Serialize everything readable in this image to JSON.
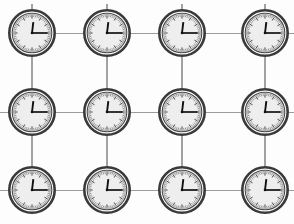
{
  "scene": {
    "title": "Grid of wall clocks",
    "description": "Twelve identical analog wall clocks arranged in a 4 by 3 lattice, joined by thin grey connecting lines",
    "width": 294,
    "height": 224,
    "background_color": "#fdfdfd"
  },
  "style": {
    "line_color": "#9b9b9b",
    "bezel_color": "#3a3a3a",
    "face_color": "#eeeeee",
    "hand_color": "#111111"
  },
  "layout": {
    "columns": 4,
    "rows": 3,
    "column_centers_x": [
      32,
      107,
      182,
      265
    ],
    "row_centers_y": [
      33,
      112,
      190
    ],
    "clock_radius": 24
  },
  "clock_common": {
    "time_label": "12:15",
    "hour_hand_angle_deg": 7,
    "minute_hand_angle_deg": 90,
    "tick_count": 60,
    "major_tick_count": 12
  },
  "clocks": [
    {
      "id": "clock-r1-c1",
      "row": 1,
      "col": 1,
      "cx": 32,
      "cy": 33,
      "time": "12:15"
    },
    {
      "id": "clock-r1-c2",
      "row": 1,
      "col": 2,
      "cx": 107,
      "cy": 33,
      "time": "12:15"
    },
    {
      "id": "clock-r1-c3",
      "row": 1,
      "col": 3,
      "cx": 182,
      "cy": 33,
      "time": "12:15"
    },
    {
      "id": "clock-r1-c4",
      "row": 1,
      "col": 4,
      "cx": 265,
      "cy": 33,
      "time": "12:15"
    },
    {
      "id": "clock-r2-c1",
      "row": 2,
      "col": 1,
      "cx": 32,
      "cy": 112,
      "time": "12:15"
    },
    {
      "id": "clock-r2-c2",
      "row": 2,
      "col": 2,
      "cx": 107,
      "cy": 112,
      "time": "12:15"
    },
    {
      "id": "clock-r2-c3",
      "row": 2,
      "col": 3,
      "cx": 182,
      "cy": 112,
      "time": "12:15"
    },
    {
      "id": "clock-r2-c4",
      "row": 2,
      "col": 4,
      "cx": 265,
      "cy": 112,
      "time": "12:15"
    },
    {
      "id": "clock-r3-c1",
      "row": 3,
      "col": 1,
      "cx": 32,
      "cy": 190,
      "time": "12:15"
    },
    {
      "id": "clock-r3-c2",
      "row": 3,
      "col": 2,
      "cx": 107,
      "cy": 190,
      "time": "12:15"
    },
    {
      "id": "clock-r3-c3",
      "row": 3,
      "col": 3,
      "cx": 182,
      "cy": 190,
      "time": "12:15"
    },
    {
      "id": "clock-r3-c4",
      "row": 3,
      "col": 4,
      "cx": 265,
      "cy": 190,
      "time": "12:15"
    }
  ],
  "connections": {
    "horizontal": [
      {
        "id": "h-r1-c1c2",
        "x1": 56,
        "y1": 33,
        "x2": 83,
        "y2": 33
      },
      {
        "id": "h-r1-c2c3",
        "x1": 131,
        "y1": 33,
        "x2": 158,
        "y2": 33
      },
      {
        "id": "h-r1-c3c4",
        "x1": 206,
        "y1": 33,
        "x2": 241,
        "y2": 33
      },
      {
        "id": "h-r1-edge-right",
        "x1": 289,
        "y1": 33,
        "x2": 294,
        "y2": 33
      },
      {
        "id": "h-r2-edge-left",
        "x1": 0,
        "y1": 112,
        "x2": 8,
        "y2": 112
      },
      {
        "id": "h-r2-c1c2",
        "x1": 56,
        "y1": 112,
        "x2": 83,
        "y2": 112
      },
      {
        "id": "h-r2-c2c3",
        "x1": 131,
        "y1": 112,
        "x2": 158,
        "y2": 112
      },
      {
        "id": "h-r2-c3c4",
        "x1": 206,
        "y1": 112,
        "x2": 241,
        "y2": 112
      },
      {
        "id": "h-r2-edge-right",
        "x1": 289,
        "y1": 112,
        "x2": 294,
        "y2": 112
      },
      {
        "id": "h-r3-edge-left",
        "x1": 0,
        "y1": 190,
        "x2": 8,
        "y2": 190
      },
      {
        "id": "h-r3-c1c2",
        "x1": 56,
        "y1": 190,
        "x2": 83,
        "y2": 190
      },
      {
        "id": "h-r3-c2c3",
        "x1": 131,
        "y1": 190,
        "x2": 158,
        "y2": 190
      },
      {
        "id": "h-r3-c3c4",
        "x1": 206,
        "y1": 190,
        "x2": 241,
        "y2": 190
      },
      {
        "id": "h-r3-edge-right",
        "x1": 289,
        "y1": 190,
        "x2": 294,
        "y2": 190
      }
    ],
    "vertical": [
      {
        "id": "v-c1-r1r2",
        "x1": 32,
        "y1": 57,
        "x2": 32,
        "y2": 88
      },
      {
        "id": "v-c2-r1r2",
        "x1": 107,
        "y1": 57,
        "x2": 107,
        "y2": 88
      },
      {
        "id": "v-c3-r1r2",
        "x1": 182,
        "y1": 57,
        "x2": 182,
        "y2": 88
      },
      {
        "id": "v-c4-r1r2",
        "x1": 265,
        "y1": 57,
        "x2": 265,
        "y2": 88
      },
      {
        "id": "v-c1-r2r3",
        "x1": 32,
        "y1": 136,
        "x2": 32,
        "y2": 166
      },
      {
        "id": "v-c2-r2r3",
        "x1": 107,
        "y1": 136,
        "x2": 107,
        "y2": 166
      },
      {
        "id": "v-c3-r2r3",
        "x1": 182,
        "y1": 136,
        "x2": 182,
        "y2": 166
      },
      {
        "id": "v-c4-r2r3",
        "x1": 265,
        "y1": 136,
        "x2": 265,
        "y2": 166
      },
      {
        "id": "v-c1-top-stub",
        "x1": 32,
        "y1": 4,
        "x2": 32,
        "y2": 9
      },
      {
        "id": "v-c2-top-stub",
        "x1": 107,
        "y1": 4,
        "x2": 107,
        "y2": 9
      },
      {
        "id": "v-c3-top-stub",
        "x1": 182,
        "y1": 4,
        "x2": 182,
        "y2": 9
      },
      {
        "id": "v-c4-top-stub",
        "x1": 265,
        "y1": 4,
        "x2": 265,
        "y2": 9
      },
      {
        "id": "v-c1-bottom-stub",
        "x1": 32,
        "y1": 160,
        "x2": 32,
        "y2": 166
      },
      {
        "id": "v-c2-bottom-stub",
        "x1": 107,
        "y1": 160,
        "x2": 107,
        "y2": 166
      },
      {
        "id": "v-c3-bottom-stub",
        "x1": 182,
        "y1": 160,
        "x2": 182,
        "y2": 166
      },
      {
        "id": "v-c4-bottom-stub",
        "x1": 265,
        "y1": 160,
        "x2": 265,
        "y2": 166
      }
    ]
  }
}
